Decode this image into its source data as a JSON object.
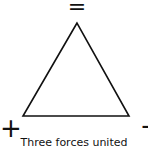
{
  "diagram": {
    "symbols": {
      "top": "=",
      "left": "+",
      "right": "-"
    },
    "caption": "Three forces united",
    "shape": "triangle",
    "colors": {
      "stroke": "#111111",
      "background": "#ffffff"
    }
  }
}
